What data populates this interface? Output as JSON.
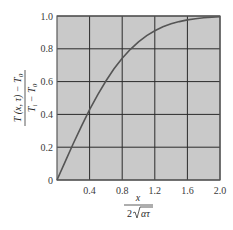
{
  "chart_data": {
    "type": "line",
    "title": "",
    "xlabel": "x / (2√(ατ))",
    "ylabel": "(T(x,τ) − T0) / (Ti − T0)",
    "xlabel_parts": {
      "numerator": "x",
      "denominator_prefix": "2",
      "denominator_radicand": "ατ"
    },
    "ylabel_parts": {
      "numerator": "T (x, τ) − T",
      "numerator_sub": "0",
      "denominator_a": "T",
      "denominator_a_sub": "i",
      "denominator_b": " − T",
      "denominator_b_sub": "0"
    },
    "xlim": [
      0,
      2.0
    ],
    "ylim": [
      0,
      1.0
    ],
    "x_ticks": [
      0.4,
      0.8,
      1.2,
      1.6,
      2.0
    ],
    "x_tick_labels": [
      "0.4",
      "0.8",
      "1.2",
      "1.6",
      "2.0"
    ],
    "y_ticks": [
      0,
      0.2,
      0.4,
      0.6,
      0.8,
      1.0
    ],
    "y_tick_labels": [
      "0",
      "0.2",
      "0.4",
      "0.6",
      "0.8",
      "1.0"
    ],
    "grid": true,
    "legend": null,
    "series": [
      {
        "name": "erf",
        "x": [
          0,
          0.1,
          0.2,
          0.3,
          0.4,
          0.5,
          0.6,
          0.7,
          0.8,
          0.9,
          1.0,
          1.1,
          1.2,
          1.3,
          1.4,
          1.5,
          1.6,
          1.7,
          1.8,
          1.9,
          2.0
        ],
        "values": [
          0,
          0.1125,
          0.2227,
          0.3286,
          0.4284,
          0.5205,
          0.6039,
          0.6778,
          0.7421,
          0.7969,
          0.8427,
          0.8802,
          0.9103,
          0.934,
          0.9523,
          0.9661,
          0.9763,
          0.9838,
          0.9891,
          0.9928,
          0.9953
        ]
      }
    ],
    "colors": {
      "plot_background": "#c9c9c9",
      "grid": "#2b2b2b",
      "curve": "#555555",
      "frame": "#555555"
    }
  }
}
